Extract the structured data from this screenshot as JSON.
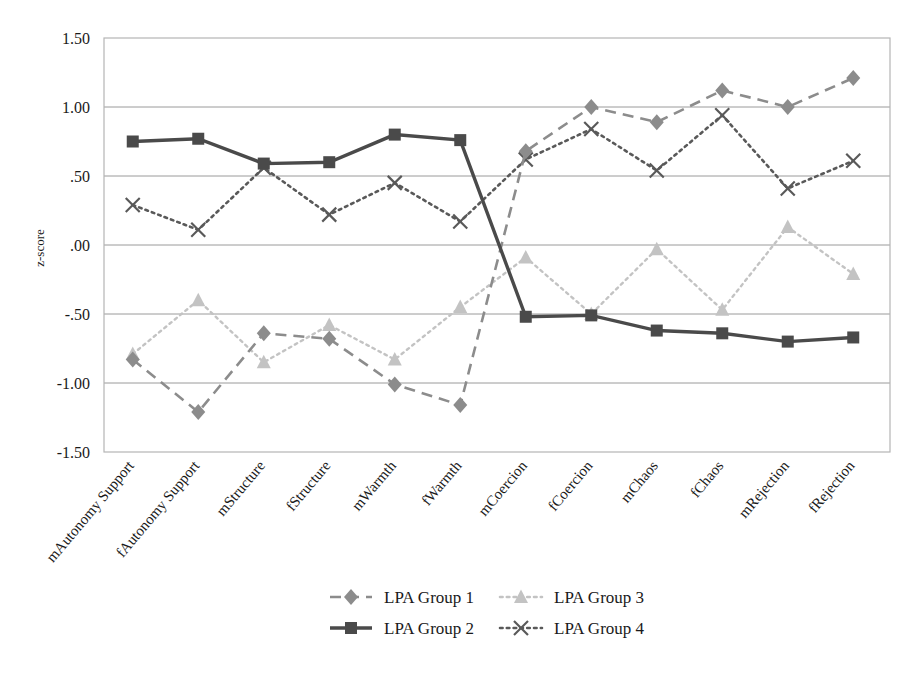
{
  "chart_data": {
    "type": "line",
    "title": "",
    "xlabel": "",
    "ylabel": "z-score",
    "ylim": [
      -1.5,
      1.5
    ],
    "yticks": [
      1.5,
      1.0,
      0.5,
      0.0,
      -0.5,
      -1.0,
      -1.5
    ],
    "ytick_labels": [
      "1.50",
      "1.00",
      ".50",
      ".00",
      "-.50",
      "-1.00",
      "-1.50"
    ],
    "grid": "horizontal",
    "legend_position": "bottom",
    "categories": [
      "mAutonomy Support",
      "fAutonomy Support",
      "mStructure",
      "fStructure",
      "mWarmth",
      "fWarmth",
      "mCoercion",
      "fCoercion",
      "mChaos",
      "fChaos",
      "mRejection",
      "fRejection"
    ],
    "series": [
      {
        "name": "LPA Group 1",
        "color": "#8c8c8c",
        "marker": "diamond",
        "line_style": "dashed",
        "values": [
          -0.83,
          -1.21,
          -0.64,
          -0.68,
          -1.01,
          -1.16,
          0.68,
          1.0,
          0.89,
          1.12,
          1.0,
          1.21
        ]
      },
      {
        "name": "LPA Group 2",
        "color": "#4a4a4a",
        "marker": "square",
        "line_style": "solid",
        "values": [
          0.75,
          0.77,
          0.59,
          0.6,
          0.8,
          0.76,
          -0.52,
          -0.51,
          -0.62,
          -0.64,
          -0.7,
          -0.67
        ]
      },
      {
        "name": "LPA Group 3",
        "color": "#c3c3c3",
        "marker": "triangle",
        "line_style": "dotted",
        "values": [
          -0.79,
          -0.4,
          -0.85,
          -0.58,
          -0.83,
          -0.45,
          -0.09,
          -0.5,
          -0.03,
          -0.47,
          0.13,
          -0.21
        ]
      },
      {
        "name": "LPA Group 4",
        "color": "#595959",
        "marker": "cross",
        "line_style": "dotted",
        "values": [
          0.29,
          0.11,
          0.56,
          0.22,
          0.45,
          0.17,
          0.62,
          0.84,
          0.54,
          0.94,
          0.41,
          0.61
        ]
      }
    ]
  },
  "legend": {
    "entries": [
      {
        "label": "LPA Group 1"
      },
      {
        "label": "LPA Group 3"
      },
      {
        "label": "LPA Group 2"
      },
      {
        "label": "LPA Group 4"
      }
    ]
  }
}
